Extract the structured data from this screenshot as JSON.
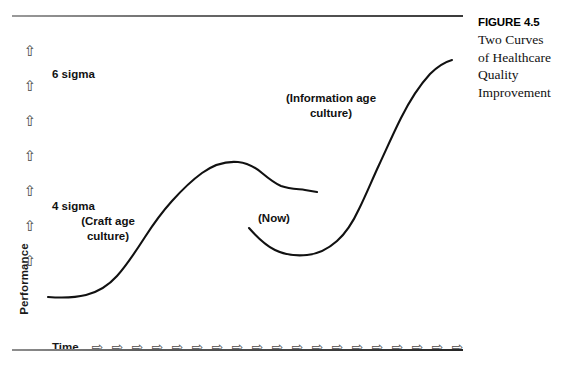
{
  "figure": {
    "caption_title": "FIGURE 4.5",
    "caption_lines": [
      "Two Curves",
      "of Healthcare",
      "Quality",
      "Improvement"
    ]
  },
  "axes": {
    "y_label": "Performance",
    "y_arrow_icon": "⇧",
    "y_arrow_count": 7,
    "x_label": "Time",
    "x_arrow_icon": "⇨",
    "x_arrow_count": 19
  },
  "annotations": {
    "six_sigma": "6 sigma",
    "four_sigma": "4 sigma",
    "craft_age": "(Craft age\nculture)",
    "information_age": "(Information age\nculture)",
    "now": "(Now)"
  },
  "colors": {
    "curve": "#111111",
    "rule": "#4a4a4a",
    "text": "#111111"
  },
  "chart_data": {
    "type": "line",
    "xlabel": "Time",
    "ylabel": "Performance",
    "grid": false,
    "legend": "none",
    "xlim": [
      0,
      100
    ],
    "ylim": [
      0,
      100
    ],
    "y_tick_labels": [
      "4 sigma",
      "6 sigma"
    ],
    "annotations": [
      {
        "text": "6 sigma",
        "x": 9,
        "y": 85
      },
      {
        "text": "4 sigma",
        "x": 9,
        "y": 44
      },
      {
        "text": "(Craft age culture)",
        "x": 16,
        "y": 38
      },
      {
        "text": "(Information age culture)",
        "x": 62,
        "y": 77
      },
      {
        "text": "(Now)",
        "x": 58,
        "y": 42
      }
    ],
    "series": [
      {
        "name": "Craft age culture curve",
        "comment": "S-shaped rise to plateau then decline",
        "points": [
          [
            1,
            11
          ],
          [
            4,
            10
          ],
          [
            8,
            10
          ],
          [
            13,
            12
          ],
          [
            18,
            17
          ],
          [
            23,
            25
          ],
          [
            28,
            34
          ],
          [
            33,
            42
          ],
          [
            38,
            50
          ],
          [
            43,
            57
          ],
          [
            47,
            62
          ],
          [
            50,
            64
          ],
          [
            54,
            64
          ],
          [
            58,
            62
          ],
          [
            62,
            58
          ],
          [
            66,
            55
          ],
          [
            68,
            53
          ]
        ]
      },
      {
        "name": "Information age culture curve",
        "comment": "dips at (Now) then steep exponential rise",
        "points": [
          [
            50,
            35
          ],
          [
            54,
            29
          ],
          [
            58,
            26
          ],
          [
            62,
            25
          ],
          [
            66,
            26
          ],
          [
            70,
            30
          ],
          [
            73,
            36
          ],
          [
            76,
            44
          ],
          [
            79,
            52
          ],
          [
            83,
            62
          ],
          [
            87,
            72
          ],
          [
            91,
            82
          ],
          [
            94,
            89
          ],
          [
            96,
            92
          ]
        ]
      }
    ]
  }
}
